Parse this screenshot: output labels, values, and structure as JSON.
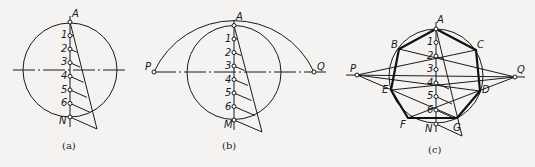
{
  "figure": {
    "subfigures": [
      {
        "id": "a",
        "caption": "(a)",
        "labels": {
          "top": "A",
          "bottom": "N",
          "divisions": [
            "1",
            "2",
            "3",
            "4",
            "5",
            "6"
          ]
        }
      },
      {
        "id": "b",
        "caption": "(b)",
        "labels": {
          "top": "A",
          "bottom": "M",
          "left": "P",
          "right": "Q",
          "divisions": [
            "1",
            "2",
            "3",
            "4",
            "5",
            "6"
          ]
        }
      },
      {
        "id": "c",
        "caption": "(c)",
        "labels": {
          "top": "A",
          "bottom": "N",
          "left": "P",
          "right": "Q",
          "divisions": [
            "1",
            "2",
            "3",
            "4",
            "5",
            "6"
          ],
          "vertices": [
            "A",
            "B",
            "C",
            "D",
            "E",
            "F",
            "G"
          ]
        }
      }
    ],
    "colors": {
      "line": "#1a1a1a",
      "background": "#f4f3f1"
    }
  }
}
